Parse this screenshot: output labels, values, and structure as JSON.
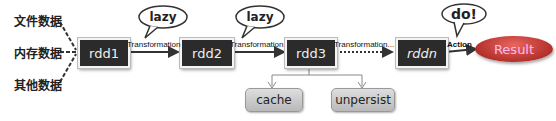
{
  "sources": [
    "文件数据",
    "内存数据",
    "其他数据"
  ],
  "rdds": [
    "rdd1",
    "rdd2",
    "rdd3",
    "rddn"
  ],
  "edges": {
    "t1": "Transformation",
    "t2": "Transformation",
    "t3": "Transformation...",
    "action": "Action"
  },
  "bubbles": {
    "b1": "lazy",
    "b2": "lazy",
    "b3": "do!"
  },
  "result": "Result",
  "ops": {
    "cache": "cache",
    "unpersist": "unpersist"
  },
  "colors": {
    "rdd_bg": "#2b2b2b",
    "result": "#c0392b",
    "pill": "#c8c8c8"
  }
}
